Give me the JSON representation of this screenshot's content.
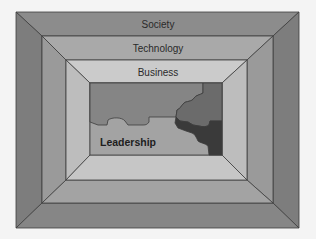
{
  "diagram": {
    "type": "nested-frames",
    "layers": [
      {
        "name": "society",
        "label": "Society"
      },
      {
        "name": "technology",
        "label": "Technology"
      },
      {
        "name": "business",
        "label": "Business"
      }
    ],
    "core": {
      "label": "Leadership",
      "pieces": [
        "light",
        "mid",
        "dark-mid",
        "dark"
      ]
    }
  },
  "colors": {
    "background": "#f4f4f4",
    "society": {
      "top": "#8c8c8c",
      "side": "#7d7d7d",
      "bottom": "#868686"
    },
    "technology": {
      "top": "#a9a9a9",
      "side": "#9a9a9a",
      "bottom": "#a3a3a3"
    },
    "business": {
      "top": "#cbcbcb",
      "side": "#bdbdbd",
      "bottom": "#c6c6c6"
    },
    "puzzle_light": "#a3a3a3",
    "puzzle_mid": "#858585",
    "puzzle_dark_mid": "#6b6b6b",
    "puzzle_dark": "#3a3a3a"
  }
}
